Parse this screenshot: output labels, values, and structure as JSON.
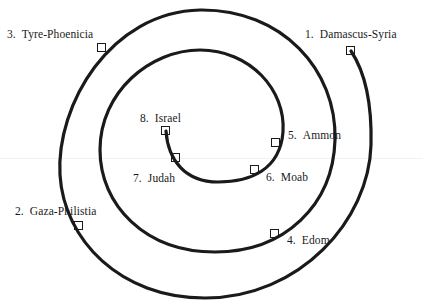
{
  "diagram": {
    "type": "spiral",
    "stroke_color": "#1a1a1a",
    "background": "#ffffff",
    "nations": [
      {
        "order": "1.",
        "name": "Damascus-Syria",
        "marker": {
          "x": 351,
          "y": 51
        },
        "label_pos": {
          "x": 305,
          "y": 29
        }
      },
      {
        "order": "2.",
        "name": "Gaza-Philistia",
        "marker": {
          "x": 79,
          "y": 226
        },
        "label_pos": {
          "x": 15,
          "y": 206
        }
      },
      {
        "order": "3.",
        "name": "Tyre-Phoenicia",
        "marker": {
          "x": 102,
          "y": 48
        },
        "label_pos": {
          "x": 7,
          "y": 29
        }
      },
      {
        "order": "4.",
        "name": "Edom",
        "marker": {
          "x": 275,
          "y": 234
        },
        "label_pos": {
          "x": 287,
          "y": 235
        }
      },
      {
        "order": "5.",
        "name": "Ammon",
        "marker": {
          "x": 276,
          "y": 143
        },
        "label_pos": {
          "x": 288,
          "y": 130
        }
      },
      {
        "order": "6.",
        "name": "Moab",
        "marker": {
          "x": 255,
          "y": 170
        },
        "label_pos": {
          "x": 266,
          "y": 172
        }
      },
      {
        "order": "7.",
        "name": "Judah",
        "marker": {
          "x": 176,
          "y": 158
        },
        "label_pos": {
          "x": 133,
          "y": 173
        }
      },
      {
        "order": "8.",
        "name": "Israel",
        "marker": {
          "x": 166,
          "y": 131
        },
        "label_pos": {
          "x": 140,
          "y": 113
        }
      }
    ]
  }
}
